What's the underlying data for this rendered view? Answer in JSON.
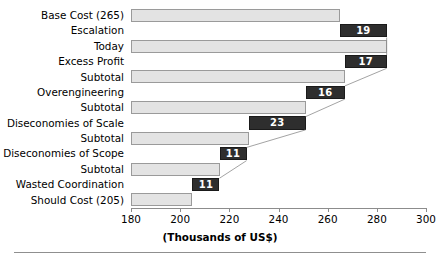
{
  "chart_data": {
    "type": "bar",
    "subtype": "waterfall-horizontal",
    "title": "",
    "xlabel": "(Thousands of US$)",
    "ylabel": "",
    "xlim": [
      180,
      300
    ],
    "xticks": [
      180,
      200,
      220,
      240,
      260,
      280,
      300
    ],
    "xticklabels": [
      "180",
      "200",
      "220",
      "240",
      "260",
      "280",
      "300"
    ],
    "grid": false,
    "legend": null,
    "units": "Thousands of US$",
    "colors": {
      "cumulative_bar": "#e3e3e3",
      "cumulative_bar_border": "#9a9a9a",
      "delta_bar": "#2e2e2e",
      "delta_label": "#ffffff",
      "axis": "#8c8c8c"
    },
    "categories": [
      "Base Cost (265)",
      "Escalation",
      "Today",
      "Excess Profit",
      "Subtotal",
      "Overengineering",
      "Subtotal",
      "Diseconomies of Scale",
      "Subtotal",
      "Diseconomies of Scope",
      "Subtotal",
      "Wasted Coordination",
      "Should Cost (205)"
    ],
    "bars": [
      {
        "label": "Base Cost (265)",
        "kind": "total",
        "start": 180,
        "end": 265,
        "value": 265,
        "data_label": ""
      },
      {
        "label": "Escalation",
        "kind": "delta",
        "start": 265,
        "end": 284,
        "value": 19,
        "data_label": "19"
      },
      {
        "label": "Today",
        "kind": "total",
        "start": 180,
        "end": 284,
        "value": 284,
        "data_label": ""
      },
      {
        "label": "Excess Profit",
        "kind": "delta",
        "start": 267,
        "end": 284,
        "value": 17,
        "data_label": "17"
      },
      {
        "label": "Subtotal",
        "kind": "total",
        "start": 180,
        "end": 267,
        "value": 267,
        "data_label": ""
      },
      {
        "label": "Overengineering",
        "kind": "delta",
        "start": 251,
        "end": 267,
        "value": 16,
        "data_label": "16"
      },
      {
        "label": "Subtotal",
        "kind": "total",
        "start": 180,
        "end": 251,
        "value": 251,
        "data_label": ""
      },
      {
        "label": "Diseconomies of Scale",
        "kind": "delta",
        "start": 228,
        "end": 251,
        "value": 23,
        "data_label": "23"
      },
      {
        "label": "Subtotal",
        "kind": "total",
        "start": 180,
        "end": 228,
        "value": 228,
        "data_label": ""
      },
      {
        "label": "Diseconomies of Scope",
        "kind": "delta",
        "start": 216,
        "end": 227,
        "value": 11,
        "data_label": "11"
      },
      {
        "label": "Subtotal",
        "kind": "total",
        "start": 180,
        "end": 216,
        "value": 216,
        "data_label": ""
      },
      {
        "label": "Wasted Coordination",
        "kind": "delta",
        "start": 205,
        "end": 216,
        "value": 11,
        "data_label": "11"
      },
      {
        "label": "Should Cost (205)",
        "kind": "total",
        "start": 180,
        "end": 205,
        "value": 205,
        "data_label": ""
      }
    ]
  }
}
